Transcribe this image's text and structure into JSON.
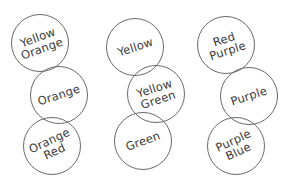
{
  "diagram": {
    "title": "",
    "circle_stroke": "#6a6a6a",
    "text_color": "#3a3a3a",
    "columns": [
      {
        "circles": [
          {
            "lines": [
              "Yellow",
              "Orange"
            ],
            "cx": 40,
            "cy": 43,
            "r": 29,
            "rotate": -20
          },
          {
            "lines": [
              "Orange"
            ],
            "cx": 59,
            "cy": 95,
            "r": 29,
            "rotate": -18
          },
          {
            "lines": [
              "Orange",
              "Red"
            ],
            "cx": 52,
            "cy": 146,
            "r": 29,
            "rotate": -25
          }
        ]
      },
      {
        "circles": [
          {
            "lines": [
              "Yellow"
            ],
            "cx": 135,
            "cy": 47,
            "r": 29,
            "rotate": -18
          },
          {
            "lines": [
              "Yellow",
              "Green"
            ],
            "cx": 156,
            "cy": 94,
            "r": 29,
            "rotate": -18
          },
          {
            "lines": [
              "Green"
            ],
            "cx": 143,
            "cy": 141,
            "r": 29,
            "rotate": -20
          }
        ]
      },
      {
        "circles": [
          {
            "lines": [
              "Red",
              "Purple"
            ],
            "cx": 226,
            "cy": 45,
            "r": 29,
            "rotate": -18
          },
          {
            "lines": [
              "Purple"
            ],
            "cx": 249,
            "cy": 96,
            "r": 29,
            "rotate": -18
          },
          {
            "lines": [
              "Purple",
              "Blue"
            ],
            "cx": 236,
            "cy": 146,
            "r": 29,
            "rotate": -25
          }
        ]
      }
    ]
  }
}
